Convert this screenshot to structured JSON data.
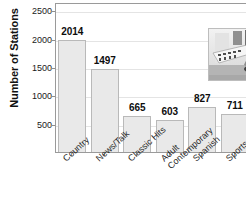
{
  "chart_data": {
    "type": "bar",
    "title": "",
    "xlabel": "",
    "ylabel": "Number of Stations",
    "categories": [
      "Country",
      "News/Talk",
      "Classic Hits",
      "Adult Contemporary",
      "Spanish",
      "Sports"
    ],
    "values": [
      2014,
      1497,
      665,
      603,
      827,
      711
    ],
    "value_labels": [
      "2014",
      "1497",
      "665",
      "603",
      "827",
      "711"
    ],
    "ylim": [
      0,
      2650
    ],
    "yticks": [
      500,
      1000,
      1500,
      2000,
      2500
    ],
    "ytick_labels": [
      "500",
      "1000",
      "1500",
      "2000",
      "2500"
    ],
    "grid": true,
    "legend": "none",
    "bar_fill": "#e9e9e9",
    "bar_edge": "#b9b9b9"
  },
  "category_lines": [
    [
      "Country"
    ],
    [
      "News/Talk"
    ],
    [
      "Classic Hits"
    ],
    [
      "Adult",
      "Contemporary"
    ],
    [
      "Spanish"
    ],
    [
      "Sports"
    ]
  ],
  "inset": {
    "name": "radio-dj-photo",
    "description": "Photograph of a radio disc jockey seated at a broadcast mixing console"
  }
}
